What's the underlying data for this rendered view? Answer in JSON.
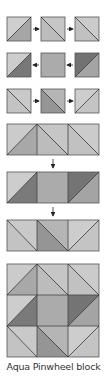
{
  "caption": "Aqua Pinwheel block",
  "colors": {
    "light": "#cdcdcd",
    "light2": "#bfbfbf",
    "medium": "#a9a9a9",
    "medium_dark": "#939393",
    "dark": "#747474",
    "stroke": "#4a4a4a",
    "arrow": "#222222"
  },
  "steps": [
    {
      "row": 1,
      "units": [
        "hst-bl-tr light/medium",
        "hst-tl-br light/light",
        "hst-tl-br light/light"
      ],
      "arrow_direction": "right"
    },
    {
      "row": 2,
      "units": [
        "hst-bl-tr light/dark",
        "plain medium",
        "hst-bl-tr dark/medium"
      ],
      "arrow_direction": "left"
    },
    {
      "row": 3,
      "units": [
        "hst-tl-br light/light",
        "hst-tl-br light/medium-dark",
        "hst-bl-tr light/light"
      ],
      "arrow_direction": "right"
    }
  ],
  "strips": [
    "Row 1 sewn strip",
    "Row 2 sewn strip",
    "Row 3 sewn strip"
  ],
  "final_block": "3x3 pinwheel block assembled"
}
